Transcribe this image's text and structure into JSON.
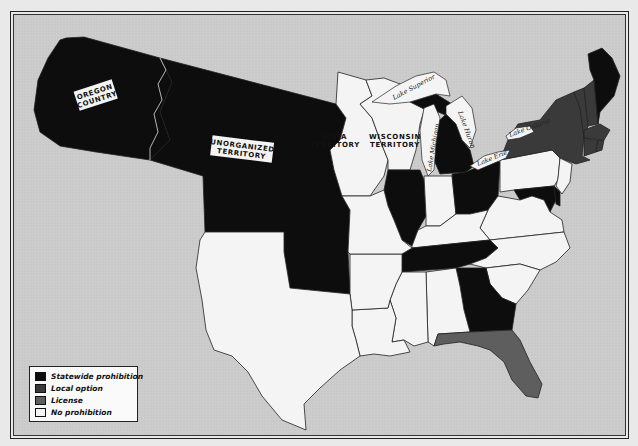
{
  "map": {
    "type": "choropleth",
    "subject": "State liquor laws in the United States",
    "colors": {
      "statewide_prohibition": "#0d0d0d",
      "local_option": "#3a3a3a",
      "license": "#5e5e5e",
      "no_prohibition": "#f4f4f4",
      "water": "#cfcfcf",
      "border": "#222222"
    },
    "labels": {
      "oregon_country": [
        "OREGON",
        "COUNTRY"
      ],
      "unorganized_territory": [
        "UNORGANIZED",
        "TERRITORY"
      ],
      "iowa_territory": [
        "IOWA",
        "TERRITORY"
      ],
      "wisconsin_territory": [
        "WISCONSIN",
        "TERRITORY"
      ]
    },
    "lakes": {
      "superior": "Lake Superior",
      "michigan": "Lake Michigan",
      "huron": "Lake Huron",
      "erie": "Lake Erie",
      "ontario": "Lake Ontario"
    },
    "regions": [
      {
        "name": "Oregon Country",
        "category": "statewide_prohibition"
      },
      {
        "name": "Unorganized Territory",
        "category": "statewide_prohibition"
      },
      {
        "name": "Iowa Territory",
        "category": "no_prohibition"
      },
      {
        "name": "Wisconsin Territory",
        "category": "no_prohibition"
      },
      {
        "name": "Michigan",
        "category": "statewide_prohibition"
      },
      {
        "name": "Illinois",
        "category": "statewide_prohibition"
      },
      {
        "name": "Indiana",
        "category": "no_prohibition"
      },
      {
        "name": "Ohio",
        "category": "statewide_prohibition"
      },
      {
        "name": "Pennsylvania",
        "category": "no_prohibition"
      },
      {
        "name": "New York",
        "category": "local_option"
      },
      {
        "name": "Vermont",
        "category": "local_option"
      },
      {
        "name": "New Hampshire",
        "category": "local_option"
      },
      {
        "name": "Massachusetts",
        "category": "local_option"
      },
      {
        "name": "Connecticut",
        "category": "local_option"
      },
      {
        "name": "Rhode Island",
        "category": "local_option"
      },
      {
        "name": "Maine",
        "category": "statewide_prohibition"
      },
      {
        "name": "New Jersey",
        "category": "no_prohibition"
      },
      {
        "name": "Delaware",
        "category": "statewide_prohibition"
      },
      {
        "name": "Maryland",
        "category": "statewide_prohibition"
      },
      {
        "name": "Virginia",
        "category": "no_prohibition"
      },
      {
        "name": "North Carolina",
        "category": "no_prohibition"
      },
      {
        "name": "South Carolina",
        "category": "no_prohibition"
      },
      {
        "name": "Georgia",
        "category": "statewide_prohibition"
      },
      {
        "name": "Florida",
        "category": "license"
      },
      {
        "name": "Alabama",
        "category": "no_prohibition"
      },
      {
        "name": "Mississippi",
        "category": "no_prohibition"
      },
      {
        "name": "Louisiana",
        "category": "no_prohibition"
      },
      {
        "name": "Tennessee",
        "category": "statewide_prohibition"
      },
      {
        "name": "Kentucky",
        "category": "no_prohibition"
      },
      {
        "name": "Missouri",
        "category": "no_prohibition"
      },
      {
        "name": "Arkansas",
        "category": "no_prohibition"
      },
      {
        "name": "Texas",
        "category": "no_prohibition"
      },
      {
        "name": "Indian Territory",
        "category": "statewide_prohibition"
      }
    ]
  },
  "legend": {
    "items": [
      {
        "label": "Statewide prohibition",
        "color": "#0d0d0d"
      },
      {
        "label": "Local option",
        "color": "#3a3a3a"
      },
      {
        "label": "License",
        "color": "#5e5e5e"
      },
      {
        "label": "No prohibition",
        "color": "#f4f4f4"
      }
    ]
  }
}
